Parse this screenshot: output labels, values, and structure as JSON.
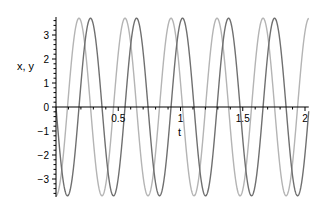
{
  "chart_data": {
    "type": "line",
    "title": "",
    "xlabel": "t",
    "ylabel": "x, y",
    "xlim": [
      0,
      2.03
    ],
    "ylim": [
      -3.75,
      3.75
    ],
    "grid": false,
    "legend": null,
    "x_ticks": [
      {
        "value": 0.5,
        "label": "0.5"
      },
      {
        "value": 1,
        "label": "1"
      },
      {
        "value": 1.5,
        "label": "1.5"
      },
      {
        "value": 2,
        "label": "2"
      }
    ],
    "y_ticks": [
      {
        "value": 3,
        "label": "3"
      },
      {
        "value": 2,
        "label": "2"
      },
      {
        "value": 1,
        "label": "1"
      },
      {
        "value": 0,
        "label": "0"
      },
      {
        "value": -1,
        "label": "−1"
      },
      {
        "value": -2,
        "label": "−2"
      },
      {
        "value": -3,
        "label": "−3"
      }
    ],
    "series": [
      {
        "name": "x",
        "color": "#b4b4b4",
        "formula": "-3.7*cos(17*t)",
        "amplitude": 3.7,
        "omega": 17,
        "phase": "cos",
        "sign": -1
      },
      {
        "name": "y",
        "color": "#707070",
        "formula": "-3.7*sin(17*t)",
        "amplitude": 3.7,
        "omega": 17,
        "phase": "sin",
        "sign": -1
      }
    ]
  },
  "labels": {
    "ylabel": "x, y",
    "xlabel": "t"
  }
}
